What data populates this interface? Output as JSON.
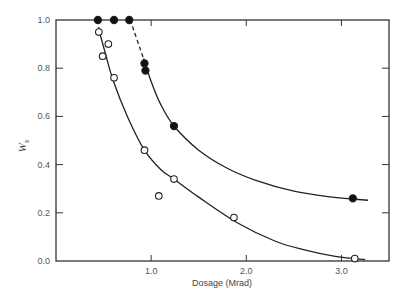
{
  "chart_data": {
    "type": "scatter",
    "title": "",
    "xlabel": "Dosage (Mrad)",
    "ylabel": "W",
    "ylabel_subscript": "s",
    "xlim": [
      0,
      3.5
    ],
    "ylim": [
      0,
      1.0
    ],
    "grid": false,
    "legend": null,
    "x_ticks": [
      1.0,
      2.0,
      3.0
    ],
    "x_tick_labels": [
      "1.0",
      "2.0",
      "3.0"
    ],
    "y_ticks": [
      0.0,
      0.2,
      0.4,
      0.6,
      0.8,
      1.0
    ],
    "y_tick_labels": [
      "0.0",
      "0.2",
      "0.4",
      "0.6",
      "0.8",
      "1.0"
    ],
    "series": [
      {
        "name": "filled",
        "marker": "filled-circle",
        "points": [
          {
            "x": 0.44,
            "y": 1.0
          },
          {
            "x": 0.61,
            "y": 1.0
          },
          {
            "x": 0.77,
            "y": 1.0
          },
          {
            "x": 0.93,
            "y": 0.82
          },
          {
            "x": 0.94,
            "y": 0.79
          },
          {
            "x": 1.24,
            "y": 0.56
          },
          {
            "x": 3.12,
            "y": 0.26
          }
        ],
        "fit_curve_dashed": [
          {
            "x": 0.78,
            "y": 1.0
          },
          {
            "x": 0.92,
            "y": 0.84
          }
        ],
        "fit_curve": [
          {
            "x": 0.92,
            "y": 0.84
          },
          {
            "x": 1.0,
            "y": 0.745
          },
          {
            "x": 1.1,
            "y": 0.65
          },
          {
            "x": 1.24,
            "y": 0.56
          },
          {
            "x": 1.5,
            "y": 0.46
          },
          {
            "x": 1.8,
            "y": 0.385
          },
          {
            "x": 2.1,
            "y": 0.335
          },
          {
            "x": 2.5,
            "y": 0.29
          },
          {
            "x": 2.9,
            "y": 0.265
          },
          {
            "x": 3.12,
            "y": 0.257
          },
          {
            "x": 3.28,
            "y": 0.252
          }
        ]
      },
      {
        "name": "open",
        "marker": "open-circle",
        "points": [
          {
            "x": 0.45,
            "y": 0.95
          },
          {
            "x": 0.55,
            "y": 0.9
          },
          {
            "x": 0.49,
            "y": 0.85
          },
          {
            "x": 0.61,
            "y": 0.76
          },
          {
            "x": 0.93,
            "y": 0.46
          },
          {
            "x": 1.08,
            "y": 0.27
          },
          {
            "x": 1.24,
            "y": 0.34
          },
          {
            "x": 1.87,
            "y": 0.18
          },
          {
            "x": 3.14,
            "y": 0.01
          }
        ],
        "fit_curve_dashed": [
          {
            "x": 0.45,
            "y": 1.0
          },
          {
            "x": 0.45,
            "y": 0.96
          }
        ],
        "fit_curve": [
          {
            "x": 0.45,
            "y": 0.96
          },
          {
            "x": 0.52,
            "y": 0.86
          },
          {
            "x": 0.6,
            "y": 0.75
          },
          {
            "x": 0.75,
            "y": 0.6
          },
          {
            "x": 0.93,
            "y": 0.46
          },
          {
            "x": 1.1,
            "y": 0.38
          },
          {
            "x": 1.24,
            "y": 0.34
          },
          {
            "x": 1.5,
            "y": 0.265
          },
          {
            "x": 1.9,
            "y": 0.16
          },
          {
            "x": 2.3,
            "y": 0.083
          },
          {
            "x": 2.6,
            "y": 0.047
          },
          {
            "x": 2.95,
            "y": 0.018
          },
          {
            "x": 3.25,
            "y": 0.006
          }
        ]
      }
    ]
  }
}
